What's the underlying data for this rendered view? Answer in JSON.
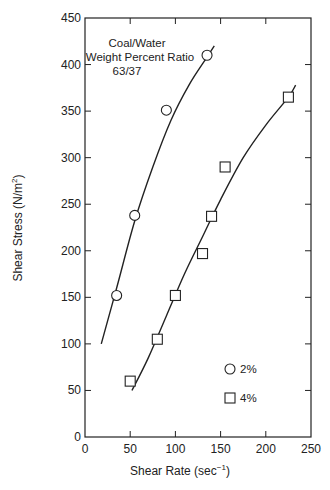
{
  "chart_data": {
    "type": "scatter",
    "title": "",
    "annotation": [
      "Coal/Water",
      "Weight Percent Ratio",
      "63/37"
    ],
    "xlabel": "Shear Rate (sec⁻¹)",
    "ylabel": "Shear Stress (N/m²)",
    "xlim": [
      0,
      250
    ],
    "ylim": [
      0,
      450
    ],
    "xticks": [
      0,
      50,
      100,
      150,
      200,
      250
    ],
    "yticks": [
      0,
      50,
      100,
      150,
      200,
      250,
      300,
      350,
      400,
      450
    ],
    "grid": false,
    "legend_position": "lower right",
    "series": [
      {
        "name": "2%",
        "marker": "circle",
        "points": [
          [
            35,
            152
          ],
          [
            55,
            238
          ],
          [
            90,
            351
          ],
          [
            135,
            410
          ]
        ],
        "fit_curve": [
          [
            18,
            100
          ],
          [
            35,
            160
          ],
          [
            55,
            232
          ],
          [
            75,
            290
          ],
          [
            95,
            340
          ],
          [
            115,
            378
          ],
          [
            135,
            408
          ],
          [
            143,
            420
          ]
        ]
      },
      {
        "name": "4%",
        "marker": "square",
        "points": [
          [
            50,
            60
          ],
          [
            80,
            105
          ],
          [
            100,
            152
          ],
          [
            130,
            197
          ],
          [
            140,
            237
          ],
          [
            155,
            290
          ],
          [
            225,
            365
          ]
        ],
        "fit_curve": [
          [
            52,
            50
          ],
          [
            70,
            85
          ],
          [
            90,
            130
          ],
          [
            110,
            175
          ],
          [
            130,
            215
          ],
          [
            150,
            255
          ],
          [
            175,
            300
          ],
          [
            200,
            335
          ],
          [
            225,
            365
          ],
          [
            233,
            378
          ]
        ]
      }
    ]
  },
  "labels": {
    "xlabel_main": "Shear Rate (sec",
    "xlabel_sup": "−1",
    "xlabel_end": ")",
    "ylabel_main": "Shear Stress (N/m",
    "ylabel_sup": "2",
    "ylabel_end": ")",
    "annot_line1": "Coal/Water",
    "annot_line2": "Weight Percent Ratio",
    "annot_line3": "63/37",
    "legend_2": "2%",
    "legend_4": "4%"
  }
}
